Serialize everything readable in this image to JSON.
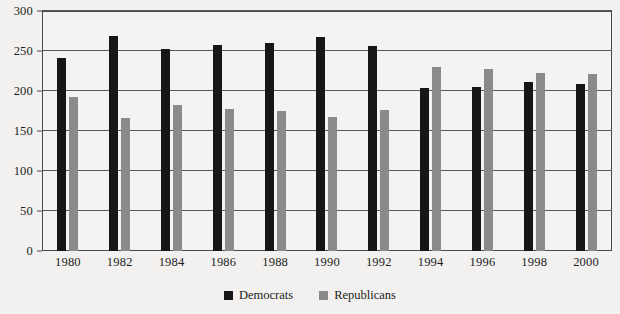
{
  "chart_data": {
    "type": "bar",
    "title": "",
    "subtitle": "",
    "xlabel": "",
    "ylabel": "",
    "ylim": [
      0,
      300
    ],
    "yticks": [
      0,
      50,
      100,
      150,
      200,
      250,
      300
    ],
    "grid": true,
    "legend_position": "bottom",
    "categories": [
      "1980",
      "1982",
      "1984",
      "1986",
      "1988",
      "1990",
      "1992",
      "1994",
      "1996",
      "1998",
      "2000"
    ],
    "series": [
      {
        "name": "Democrats",
        "color": "#161616",
        "values": [
          241,
          269,
          253,
          258,
          260,
          267,
          256,
          204,
          205,
          211,
          209
        ]
      },
      {
        "name": "Republicans",
        "color": "#8a8a8a",
        "values": [
          192,
          166,
          182,
          177,
          175,
          167,
          176,
          230,
          227,
          223,
          221
        ]
      }
    ]
  },
  "axis": {
    "y_tick_labels": [
      "300",
      "250",
      "200",
      "150",
      "100",
      "50",
      "0"
    ],
    "x_tick_labels": [
      "1980",
      "1982",
      "1984",
      "1986",
      "1988",
      "1990",
      "1992",
      "1994",
      "1996",
      "1998",
      "2000"
    ]
  },
  "legend": {
    "items": [
      {
        "label": "Democrats",
        "color": "#161616",
        "swatch": "square-swatch"
      },
      {
        "label": "Republicans",
        "color": "#8a8a8a",
        "swatch": "square-swatch"
      }
    ]
  },
  "colors": {
    "democrat": "#161616",
    "republican": "#8a8a8a",
    "grid": "#585858",
    "frame": "#4a4a4a",
    "background": "#f2f1ef",
    "text": "#1d1d1d"
  }
}
